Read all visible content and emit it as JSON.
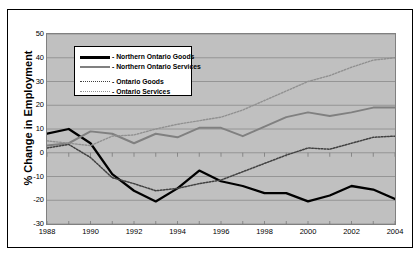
{
  "chart_data": {
    "type": "line",
    "title": "",
    "xlabel": "",
    "ylabel": "% Change in Employment",
    "xlim": [
      1988,
      2004
    ],
    "ylim": [
      -30,
      50
    ],
    "grid": true,
    "legend_position": "upper-left-inside",
    "x": [
      1988,
      1989,
      1990,
      1991,
      1992,
      1993,
      1994,
      1995,
      1996,
      1997,
      1998,
      1999,
      2000,
      2001,
      2002,
      2003,
      2004
    ],
    "x_ticks": [
      1988,
      1990,
      1992,
      1994,
      1996,
      1998,
      2000,
      2002,
      2004
    ],
    "y_ticks": [
      -30,
      -20,
      -10,
      0,
      10,
      20,
      30,
      40,
      50
    ],
    "series": [
      {
        "name": "Northern Ontario Goods",
        "style": "solid-thick",
        "color": "#000000",
        "values": [
          8,
          10,
          4,
          -9,
          -16,
          -20.5,
          -15,
          -7.5,
          -12,
          -14,
          -17,
          -17,
          -20.5,
          -18,
          -14,
          -15.5,
          -19.5
        ]
      },
      {
        "name": "Northern Ontario Services",
        "style": "solid-medium",
        "color": "#808080",
        "values": [
          3,
          4,
          9,
          8,
          4,
          8,
          6.5,
          10.5,
          10.5,
          7,
          11,
          15,
          17,
          15.5,
          17,
          19,
          19
        ]
      },
      {
        "name": "Ontario Goods",
        "style": "dotted-dark",
        "color": "#404040",
        "values": [
          2,
          3.5,
          -2,
          -10.5,
          -13,
          -16,
          -15,
          -13,
          -11.5,
          -8,
          -4.5,
          -1,
          2,
          1.5,
          4,
          6.5,
          7
        ]
      },
      {
        "name": "Ontario Services",
        "style": "dotted-light",
        "color": "#909090",
        "values": [
          5,
          4,
          3,
          7,
          7.5,
          10,
          12,
          13.5,
          15,
          18,
          22,
          26,
          30,
          32.5,
          36,
          39,
          40
        ]
      }
    ]
  },
  "axis": {
    "y_title": "% Change in Employment"
  },
  "legend": {
    "entries": [
      {
        "label": "- Northern Ontario Goods"
      },
      {
        "label": "- Northern Ontario Services"
      },
      {
        "label": "- Ontario Goods"
      },
      {
        "label": "- Ontario Services"
      }
    ]
  }
}
